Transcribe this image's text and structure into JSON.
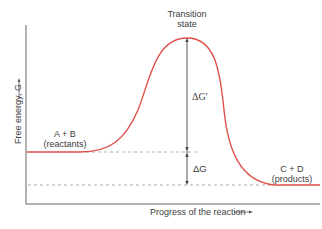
{
  "diagram": {
    "type": "reaction-energy-profile",
    "y_axis_label": "Free energy, G",
    "x_axis_label": "Progress of the reaction",
    "peak_label_line1": "Transition",
    "peak_label_line2": "state",
    "reactants_line1": "A + B",
    "reactants_line2": "(reactants)",
    "products_line1": "C + D",
    "products_line2": "(products)",
    "activation_energy_label": "ΔG‡",
    "activation_energy_display": "ΔG'",
    "free_energy_change_label": "ΔG",
    "colors": {
      "curve": "#e0514a",
      "axes": "#555555",
      "dashed": "#9a9a9a",
      "text": "#3c3c3c"
    }
  }
}
